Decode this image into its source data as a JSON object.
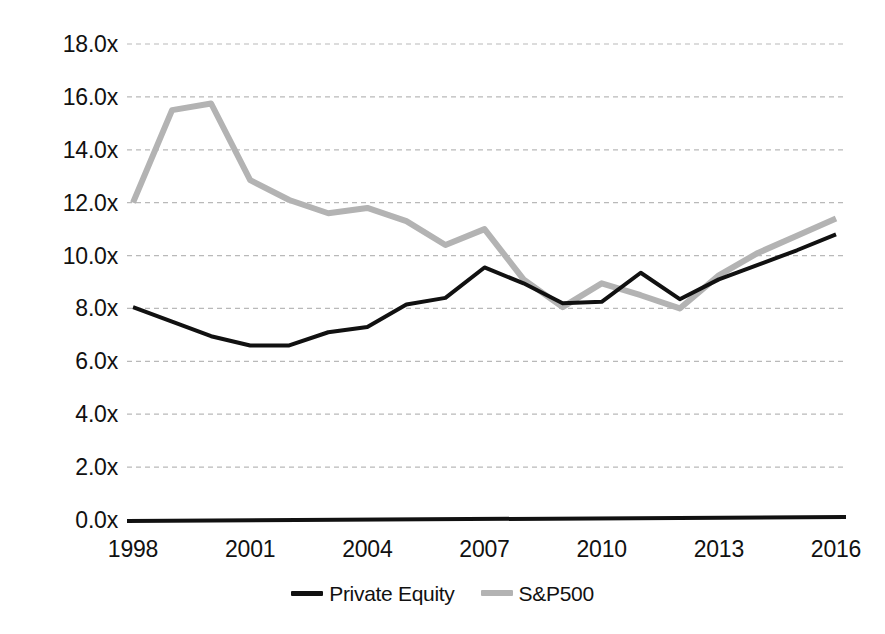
{
  "chart_data": {
    "type": "line",
    "title": "",
    "subtitle": "",
    "xlabel": "",
    "ylabel": "",
    "x": [
      1998,
      1999,
      2000,
      2001,
      2002,
      2003,
      2004,
      2005,
      2006,
      2007,
      2008,
      2009,
      2010,
      2011,
      2012,
      2013,
      2014,
      2015,
      2016
    ],
    "xlim": [
      1998,
      2016
    ],
    "ylim": [
      0.0,
      18.0
    ],
    "y_ticks": [
      0.0,
      2.0,
      4.0,
      6.0,
      8.0,
      10.0,
      12.0,
      14.0,
      16.0,
      18.0
    ],
    "y_tick_labels": [
      "0.0x",
      "2.0x",
      "4.0x",
      "6.0x",
      "8.0x",
      "10.0x",
      "12.0x",
      "14.0x",
      "16.0x",
      "18.0x"
    ],
    "x_ticks": [
      1998,
      2001,
      2004,
      2007,
      2010,
      2013,
      2016
    ],
    "x_tick_labels": [
      "1998",
      "2001",
      "2004",
      "2007",
      "2010",
      "2013",
      "2016"
    ],
    "grid": true,
    "grid_style": "dashed-horizontal",
    "grid_color": "#b9b9b9",
    "legend_position": "bottom-center",
    "series": [
      {
        "name": "Private Equity",
        "color": "#111111",
        "width": 4,
        "values": [
          8.05,
          7.5,
          6.95,
          6.6,
          6.6,
          7.1,
          7.3,
          8.15,
          8.4,
          9.55,
          8.95,
          8.2,
          8.25,
          9.35,
          8.35,
          9.1,
          9.65,
          10.2,
          10.8
        ]
      },
      {
        "name": "S&P500",
        "color": "#b3b3b3",
        "width": 6,
        "values": [
          12.0,
          15.5,
          15.75,
          12.85,
          12.1,
          11.6,
          11.8,
          11.3,
          10.4,
          11.0,
          9.1,
          8.05,
          8.95,
          8.5,
          8.0,
          9.25,
          10.1,
          10.75,
          11.4
        ]
      }
    ]
  },
  "y_axis": {
    "ticks": [
      {
        "label": "18.0x",
        "value": 18.0
      },
      {
        "label": "16.0x",
        "value": 16.0
      },
      {
        "label": "14.0x",
        "value": 14.0
      },
      {
        "label": "12.0x",
        "value": 12.0
      },
      {
        "label": "10.0x",
        "value": 10.0
      },
      {
        "label": "8.0x",
        "value": 8.0
      },
      {
        "label": "6.0x",
        "value": 6.0
      },
      {
        "label": "4.0x",
        "value": 4.0
      },
      {
        "label": "2.0x",
        "value": 2.0
      },
      {
        "label": "0.0x",
        "value": 0.0
      }
    ]
  },
  "x_axis": {
    "ticks": [
      {
        "label": "1998",
        "value": 1998
      },
      {
        "label": "2001",
        "value": 2001
      },
      {
        "label": "2004",
        "value": 2004
      },
      {
        "label": "2007",
        "value": 2007
      },
      {
        "label": "2010",
        "value": 2010
      },
      {
        "label": "2013",
        "value": 2013
      },
      {
        "label": "2016",
        "value": 2016
      }
    ]
  },
  "legend": {
    "entries": [
      {
        "label": "Private Equity",
        "color": "#111111"
      },
      {
        "label": "S&P500",
        "color": "#b3b3b3"
      }
    ]
  },
  "colors": {
    "background": "#ffffff",
    "axis": "#111111",
    "grid": "#b9b9b9",
    "private_equity": "#111111",
    "sp500": "#b3b3b3"
  }
}
